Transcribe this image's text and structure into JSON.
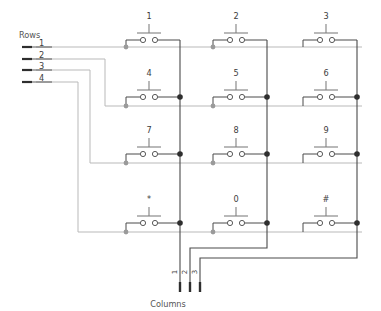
{
  "diagram": {
    "title_rows": "Rows",
    "title_columns": "Columns",
    "type": "keypad-matrix-schematic",
    "row_labels": [
      "1",
      "2",
      "3",
      "4"
    ],
    "column_labels": [
      "1",
      "2",
      "3"
    ],
    "keys": [
      [
        "1",
        "2",
        "3"
      ],
      [
        "4",
        "5",
        "6"
      ],
      [
        "7",
        "8",
        "9"
      ],
      [
        "*",
        "0",
        "#"
      ]
    ],
    "colors": {
      "row_wire": "#b9b9b9",
      "column_wire": "#4a4a4a",
      "switch_wire": "#4a4a4a",
      "actuator": "#808080",
      "node_dark": "#2e2e2e",
      "node_light": "#9a9a9a",
      "text": "#3c3c3c",
      "background": "#ffffff"
    }
  }
}
